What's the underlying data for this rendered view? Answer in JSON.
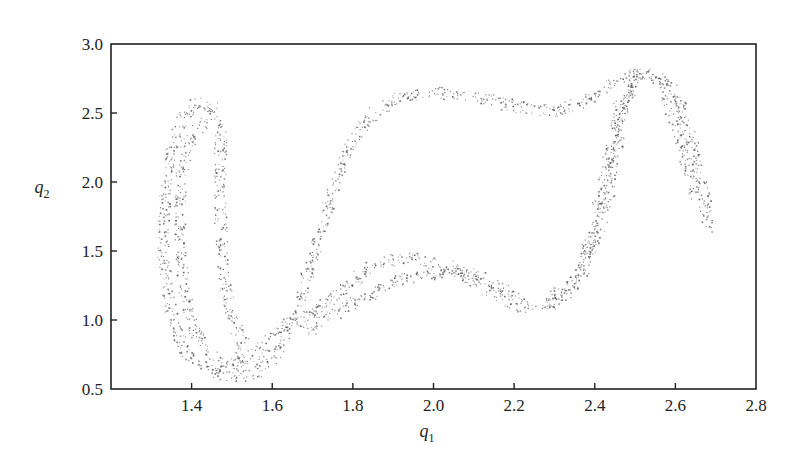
{
  "chart_data": {
    "type": "scatter",
    "title": "",
    "xlabel": "q_1",
    "ylabel": "q_2",
    "xlabel_main": "q",
    "xlabel_sub": "1",
    "ylabel_main": "q",
    "ylabel_sub": "2",
    "xlim": [
      1.2,
      2.8
    ],
    "ylim": [
      0.5,
      3.0
    ],
    "xticks": [
      1.4,
      1.6,
      1.8,
      2.0,
      2.2,
      2.4,
      2.6,
      2.8
    ],
    "xtick_labels": [
      "1.4",
      "1.6",
      "1.8",
      "2.0",
      "2.2",
      "2.4",
      "2.6",
      "2.8"
    ],
    "yticks": [
      0.5,
      1.0,
      1.5,
      2.0,
      2.5,
      3.0
    ],
    "ytick_labels": [
      "0.5",
      "1.0",
      "1.5",
      "2.0",
      "2.5",
      "3.0"
    ],
    "grid": false,
    "legend": null,
    "marker_color": "#555555",
    "series": [
      {
        "name": "left-loop",
        "description": "closed loop of scattered points at left, q1 ~1.33-1.48, q2 ~0.65-2.58",
        "points": [
          [
            1.45,
            2.55
          ],
          [
            1.41,
            2.58
          ],
          [
            1.37,
            2.45
          ],
          [
            1.34,
            2.1
          ],
          [
            1.33,
            1.75
          ],
          [
            1.33,
            1.4
          ],
          [
            1.35,
            1.05
          ],
          [
            1.38,
            0.8
          ],
          [
            1.43,
            0.68
          ],
          [
            1.5,
            0.7
          ],
          [
            1.53,
            0.82
          ],
          [
            1.5,
            1.0
          ],
          [
            1.48,
            1.3
          ],
          [
            1.47,
            1.7
          ],
          [
            1.47,
            2.1
          ],
          [
            1.47,
            2.4
          ],
          [
            1.45,
            2.55
          ]
        ]
      },
      {
        "name": "inner-left-strand",
        "description": "second strand inside left loop",
        "points": [
          [
            1.43,
            2.45
          ],
          [
            1.39,
            2.3
          ],
          [
            1.37,
            2.0
          ],
          [
            1.37,
            1.6
          ],
          [
            1.38,
            1.2
          ],
          [
            1.41,
            0.9
          ],
          [
            1.45,
            0.75
          ]
        ]
      },
      {
        "name": "main-band-upper",
        "description": "band rising from bottom-left to top arc then over to right peak",
        "points": [
          [
            1.45,
            0.62
          ],
          [
            1.5,
            0.58
          ],
          [
            1.56,
            0.62
          ],
          [
            1.62,
            0.8
          ],
          [
            1.66,
            1.1
          ],
          [
            1.7,
            1.45
          ],
          [
            1.74,
            1.85
          ],
          [
            1.78,
            2.2
          ],
          [
            1.83,
            2.45
          ],
          [
            1.9,
            2.6
          ],
          [
            2.0,
            2.65
          ],
          [
            2.1,
            2.63
          ],
          [
            2.2,
            2.55
          ],
          [
            2.3,
            2.52
          ],
          [
            2.37,
            2.58
          ],
          [
            2.42,
            2.68
          ],
          [
            2.48,
            2.78
          ],
          [
            2.55,
            2.78
          ],
          [
            2.6,
            2.65
          ],
          [
            2.64,
            2.3
          ],
          [
            2.67,
            1.95
          ],
          [
            2.68,
            1.65
          ]
        ]
      },
      {
        "name": "main-band-lower",
        "description": "lower sweep from left-bottom through middle dip back up to right",
        "points": [
          [
            1.5,
            0.65
          ],
          [
            1.56,
            0.78
          ],
          [
            1.62,
            0.95
          ],
          [
            1.7,
            1.05
          ],
          [
            1.78,
            1.25
          ],
          [
            1.86,
            1.42
          ],
          [
            1.95,
            1.45
          ],
          [
            2.05,
            1.38
          ],
          [
            2.14,
            1.2
          ],
          [
            2.22,
            1.1
          ],
          [
            2.3,
            1.12
          ],
          [
            2.36,
            1.3
          ],
          [
            2.4,
            1.6
          ],
          [
            2.43,
            1.9
          ],
          [
            2.45,
            2.2
          ],
          [
            2.47,
            2.5
          ],
          [
            2.5,
            2.75
          ],
          [
            2.53,
            2.8
          ],
          [
            2.57,
            2.7
          ],
          [
            2.6,
            2.45
          ],
          [
            2.62,
            2.2
          ],
          [
            2.65,
            1.9
          ]
        ]
      },
      {
        "name": "mid-lower-strand",
        "description": "strand from ~(1.7,0.95) to (2.0,1.3)",
        "points": [
          [
            1.68,
            0.92
          ],
          [
            1.75,
            1.05
          ],
          [
            1.82,
            1.15
          ],
          [
            1.9,
            1.28
          ],
          [
            1.98,
            1.32
          ],
          [
            2.05,
            1.37
          ],
          [
            2.12,
            1.3
          ],
          [
            2.2,
            1.18
          ]
        ]
      },
      {
        "name": "right-inner-strand",
        "description": "inner strand in right arch",
        "points": [
          [
            2.28,
            1.15
          ],
          [
            2.34,
            1.25
          ],
          [
            2.38,
            1.5
          ],
          [
            2.41,
            1.85
          ],
          [
            2.44,
            2.25
          ],
          [
            2.46,
            2.55
          ],
          [
            2.5,
            2.72
          ]
        ]
      }
    ]
  }
}
